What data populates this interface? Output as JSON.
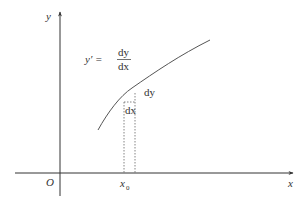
{
  "figure": {
    "type": "derivative-geometric-illustration",
    "colors": {
      "axis": "#333333",
      "curve": "#555555",
      "dotted": "#666666",
      "text": "#333333",
      "background": "#ffffff"
    },
    "axes": {
      "x_label": "x",
      "y_label": "y",
      "origin_label": "O"
    },
    "annotations": {
      "point_label": "x",
      "point_subscript": "0",
      "formula_lhs": "y′ =",
      "formula_numerator": "dy",
      "formula_denominator": "dx",
      "dy_label": "dy",
      "dx_label": "dx"
    }
  }
}
